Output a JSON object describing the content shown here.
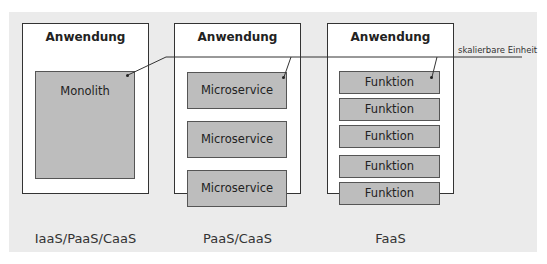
{
  "diagram": {
    "columns": [
      {
        "title": "Anwendung",
        "blocks": [
          "Monolith"
        ],
        "caption": "IaaS/PaaS/CaaS"
      },
      {
        "title": "Anwendung",
        "blocks": [
          "Microservice",
          "Microservice",
          "Microservice"
        ],
        "caption": "PaaS/CaaS"
      },
      {
        "title": "Anwendung",
        "blocks": [
          "Funktion",
          "Funktion",
          "Funktion",
          "Funktion",
          "Funktion"
        ],
        "caption": "FaaS"
      }
    ],
    "scale_label": "skalierbare Einheit",
    "colors": {
      "background": "#ebebeb",
      "box": "#ffffff",
      "block": "#bdbdbd",
      "border": "#333333"
    }
  }
}
